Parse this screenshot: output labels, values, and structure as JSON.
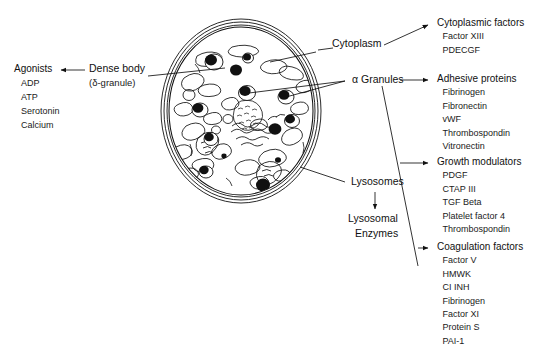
{
  "diagram": {
    "cell_label": "platelet-cell",
    "ink_color": "#111111"
  },
  "left": {
    "dense_body": {
      "label": "Dense body",
      "sublabel": "(δ-granule)"
    },
    "agonists": {
      "header": "Agonists",
      "items": [
        "ADP",
        "ATP",
        "Serotonin",
        "Calcium"
      ]
    }
  },
  "center": {
    "cytoplasm": "Cytoplasm",
    "alpha_granules": "α Granules",
    "lysosomes": "Lysosomes",
    "lysosomal_enzymes_line1": "Lysosomal",
    "lysosomal_enzymes_line2": "Enzymes"
  },
  "right": {
    "cytoplasmic_factors": {
      "header": "Cytoplasmic factors",
      "items": [
        "Factor XIII",
        "PDECGF"
      ]
    },
    "adhesive_proteins": {
      "header": "Adhesive proteins",
      "items": [
        "Fibrinogen",
        "Fibronectin",
        "vWF",
        "Thrombospondin",
        "Vitronectin"
      ]
    },
    "growth_modulators": {
      "header": "Growth modulators",
      "items": [
        "PDGF",
        "CTAP III",
        "TGF Beta",
        "Platelet factor 4",
        "Thrombospondin"
      ]
    },
    "coagulation_factors": {
      "header": "Coagulation factors",
      "items": [
        "Factor V",
        "HMWK",
        "CI INH",
        "Fibrinogen",
        "Factor XI",
        "Protein S",
        "PAI-1"
      ]
    }
  }
}
